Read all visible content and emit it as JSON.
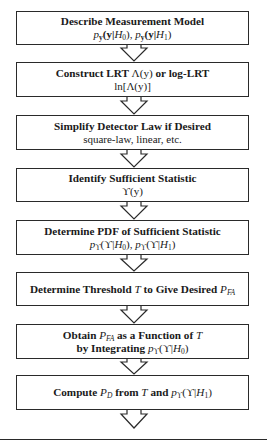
{
  "diagram": {
    "type": "flowchart",
    "direction": "top-to-bottom",
    "steps": [
      {
        "title": "Describe Measurement Model",
        "subtitle": "p_y(y|H0), p_y(y|H1)"
      },
      {
        "title": "Construct LRT Λ(y) or log-LRT",
        "subtitle": "ln[Λ(y)]"
      },
      {
        "title": "Simplify Detector Law if Desired",
        "subtitle": "square-law, linear, etc."
      },
      {
        "title": "Identify Sufficient Statistic",
        "subtitle": "ϒ(y)"
      },
      {
        "title": "Determine PDF of Sufficient Statistic",
        "subtitle": "p_ϒ(ϒ|H0), p_ϒ(ϒ|H1)"
      },
      {
        "title": "Determine Threshold T to Give Desired P_FA",
        "subtitle": ""
      },
      {
        "title": "Obtain P_FA as a Function of T",
        "subtitle": "by Integrating p_ϒ(ϒ|H0)"
      },
      {
        "title": "Compute P_D from T and p_ϒ(ϒ|H1)",
        "subtitle": ""
      }
    ]
  },
  "text": {
    "s1": {
      "t": "Describe Measurement Model"
    },
    "s2": {
      "t_a": "Construct LRT ",
      "t_lam": "Λ(y)",
      "t_b": " or log-LRT",
      "sub_a": "ln[",
      "sub_lam": "Λ(y)",
      "sub_b": "]"
    },
    "s3": {
      "t": "Simplify Detector Law if Desired",
      "sub": "square-law, linear, etc."
    },
    "s4": {
      "t": "Identify Sufficient Statistic",
      "sub": "ϒ(y)"
    },
    "s5": {
      "t": "Determine PDF of Sufficient Statistic"
    },
    "s6": {
      "t_a": "Determine Threshold ",
      "t_T": "T",
      "t_b": " to Give Desired "
    },
    "s7": {
      "t_a": "Obtain ",
      "t_b": " as a Function of ",
      "t_T": "T",
      "l2": "by Integrating "
    },
    "s8": {
      "t_a": "Compute ",
      "t_b": " from ",
      "t_T": "T",
      "t_c": " and "
    },
    "math": {
      "p": "p",
      "y_sub": "y",
      "yb": "(y|",
      "H": "H",
      "zero": "0",
      "one": "1",
      "close": ")",
      "comma": ", ",
      "P": "P",
      "FA": "FA",
      "D": "D",
      "ups_sub": "ϒ",
      "upsb": "(ϒ|"
    }
  }
}
